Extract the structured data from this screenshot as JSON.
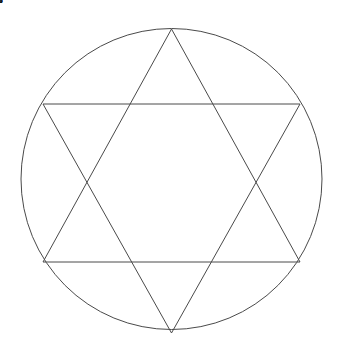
{
  "diagram": {
    "type": "geometric-diagram",
    "background_color": "#ffffff",
    "stroke_color": "#4a4a4a",
    "box_stroke_color": "#5a5a5a",
    "box_fill_color": "#ffffff",
    "text_color": "#1a1a1a",
    "circle": {
      "name": "outer-circle",
      "cx": 171.5,
      "cy": 179,
      "r": 150.5
    },
    "triangle_up": {
      "name": "upward-triangle",
      "points": "171.5,29 300,262 43,262"
    },
    "triangle_down": {
      "name": "downward-triangle",
      "points": "171.5,333 43,104 300,104"
    },
    "boxes": [
      {
        "id": "box-1",
        "label": "1",
        "x": 156,
        "y": 262,
        "w": 32,
        "h": 49
      },
      {
        "id": "box-2",
        "label": "2",
        "x": 242,
        "y": 211,
        "w": 32,
        "h": 49
      },
      {
        "id": "box-3",
        "label": "3",
        "x": 71,
        "y": 211,
        "w": 32,
        "h": 49
      },
      {
        "id": "box-4",
        "label": "4",
        "x": 242,
        "y": 107,
        "w": 32,
        "h": 49
      },
      {
        "id": "box-5",
        "label": "5",
        "x": 71,
        "y": 107,
        "w": 32,
        "h": 49
      },
      {
        "id": "box-6",
        "label": "6",
        "x": 156,
        "y": 56,
        "w": 32,
        "h": 49
      },
      {
        "id": "box-7",
        "label": "7",
        "x": 156,
        "y": 156,
        "w": 32,
        "h": 49
      }
    ]
  }
}
